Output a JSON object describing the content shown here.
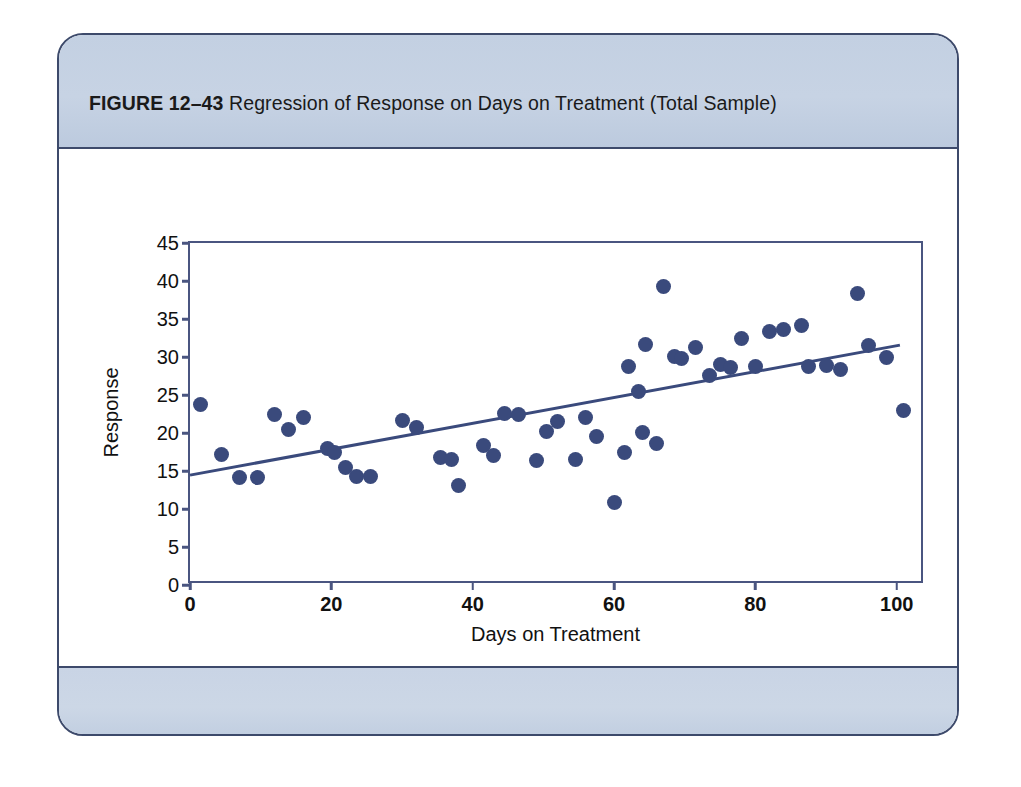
{
  "figure": {
    "label": "FIGURE 12–43",
    "caption": "Regression of Response on Days on Treatment (Total Sample)",
    "frame_color": "#3d4a6b",
    "band_color": "#c7d3e4"
  },
  "chart_data": {
    "type": "scatter",
    "title": "Regression of Response on Days on Treatment (Total Sample)",
    "xlabel": "Days on Treatment",
    "ylabel": "Response",
    "xlim": [
      0,
      104
    ],
    "ylim": [
      0,
      45
    ],
    "xticks": [
      0,
      20,
      40,
      60,
      80,
      100
    ],
    "yticks": [
      0,
      5,
      10,
      15,
      20,
      25,
      30,
      35,
      40,
      45
    ],
    "grid": false,
    "legend": null,
    "marker_color": "#3a4a7c",
    "line_color": "#3a4a7c",
    "regression_line": {
      "x": [
        0,
        101
      ],
      "y": [
        14.1,
        31.4
      ],
      "intercept": 14.1,
      "slope": 0.171
    },
    "points": [
      [
        1.5,
        23.8
      ],
      [
        4.5,
        17.2
      ],
      [
        7.0,
        14.1
      ],
      [
        9.5,
        14.1
      ],
      [
        12.0,
        22.4
      ],
      [
        14.0,
        20.5
      ],
      [
        16.0,
        22.1
      ],
      [
        19.5,
        17.9
      ],
      [
        20.5,
        17.4
      ],
      [
        22.0,
        15.5
      ],
      [
        23.5,
        14.3
      ],
      [
        25.5,
        14.3
      ],
      [
        30.0,
        21.7
      ],
      [
        32.0,
        20.7
      ],
      [
        35.5,
        16.8
      ],
      [
        37.0,
        16.5
      ],
      [
        38.0,
        13.1
      ],
      [
        41.5,
        18.4
      ],
      [
        43.0,
        17.0
      ],
      [
        44.5,
        22.6
      ],
      [
        46.5,
        22.4
      ],
      [
        49.0,
        16.4
      ],
      [
        50.5,
        20.2
      ],
      [
        52.0,
        21.5
      ],
      [
        54.5,
        16.5
      ],
      [
        56.0,
        22.0
      ],
      [
        57.5,
        19.5
      ],
      [
        60.0,
        10.9
      ],
      [
        61.5,
        17.4
      ],
      [
        62.0,
        28.8
      ],
      [
        63.5,
        25.4
      ],
      [
        64.0,
        20.1
      ],
      [
        64.5,
        31.7
      ],
      [
        66.0,
        18.6
      ],
      [
        67.0,
        39.3
      ],
      [
        68.5,
        30.1
      ],
      [
        69.5,
        29.8
      ],
      [
        71.5,
        31.3
      ],
      [
        73.5,
        27.6
      ],
      [
        75.0,
        29.0
      ],
      [
        76.5,
        28.6
      ],
      [
        78.0,
        32.4
      ],
      [
        80.0,
        28.8
      ],
      [
        82.0,
        33.4
      ],
      [
        84.0,
        33.6
      ],
      [
        86.5,
        34.1
      ],
      [
        87.5,
        28.8
      ],
      [
        90.0,
        28.9
      ],
      [
        92.0,
        28.3
      ],
      [
        94.5,
        38.3
      ],
      [
        96.0,
        31.5
      ],
      [
        98.5,
        30.0
      ],
      [
        101.0,
        23.0
      ]
    ]
  }
}
